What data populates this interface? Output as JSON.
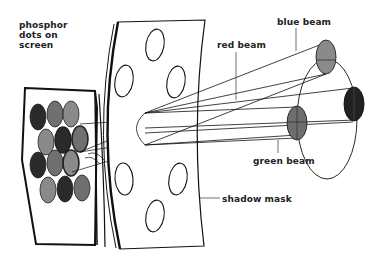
{
  "diagram": {
    "labels": {
      "phosphor_dots": "phosphor dots on screen",
      "red_beam": "red beam",
      "blue_beam": "blue beam",
      "green_beam": "green beam",
      "shadow_mask": "shadow mask"
    },
    "colors": {
      "ink": "#111111",
      "red_dot": "#2a2a2a",
      "green_dot": "#6e6e6e",
      "blue_dot": "#8a8a8a",
      "background": "#ffffff"
    },
    "components": [
      {
        "id": "screen",
        "description": "phosphor screen with triads of dots"
      },
      {
        "id": "shadow-mask",
        "description": "curved plate with holes"
      },
      {
        "id": "electron-guns",
        "description": "three beams converging through mask hole"
      }
    ]
  }
}
